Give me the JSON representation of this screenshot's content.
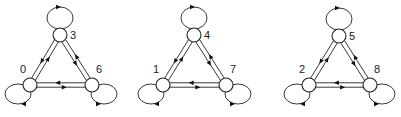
{
  "diagram": {
    "type": "state-graph",
    "colors": {
      "stroke": "#222222",
      "node_fill": "#ffffff",
      "background": "#ffffff"
    },
    "components": [
      {
        "id": "A",
        "nodes": [
          {
            "label": "3",
            "x": 60,
            "y": 35,
            "label_dx": 10,
            "label_dy": 4,
            "loop": "top"
          },
          {
            "label": "0",
            "x": 30,
            "y": 85,
            "label_dx": -10,
            "label_dy": -12,
            "loop": "bottom-left"
          },
          {
            "label": "6",
            "x": 92,
            "y": 85,
            "label_dx": 4,
            "label_dy": -12,
            "loop": "bottom-right"
          }
        ]
      },
      {
        "id": "B",
        "nodes": [
          {
            "label": "4",
            "x": 194,
            "y": 35,
            "label_dx": 10,
            "label_dy": 4,
            "loop": "top"
          },
          {
            "label": "1",
            "x": 163,
            "y": 85,
            "label_dx": -10,
            "label_dy": -12,
            "loop": "bottom-left"
          },
          {
            "label": "7",
            "x": 226,
            "y": 85,
            "label_dx": 4,
            "label_dy": -12,
            "loop": "bottom-right"
          }
        ]
      },
      {
        "id": "C",
        "nodes": [
          {
            "label": "5",
            "x": 339,
            "y": 36,
            "label_dx": 10,
            "label_dy": 4,
            "loop": "top"
          },
          {
            "label": "2",
            "x": 309,
            "y": 85,
            "label_dx": -10,
            "label_dy": -12,
            "loop": "bottom-left"
          },
          {
            "label": "8",
            "x": 370,
            "y": 85,
            "label_dx": 4,
            "label_dy": -12,
            "loop": "bottom-right"
          }
        ]
      }
    ],
    "edges_per_component": "each ordered pair (bidirectional) plus self-loop on every node",
    "node_radius": 7
  }
}
